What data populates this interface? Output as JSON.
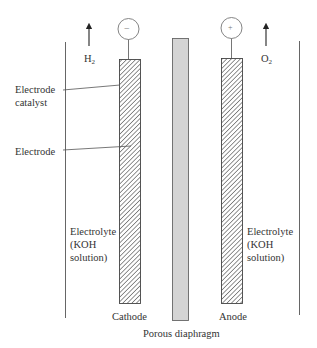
{
  "diagram": {
    "type": "alkaline water electrolysis cell",
    "gases": {
      "left": {
        "symbol": "H",
        "subscript": "2"
      },
      "right": {
        "symbol": "O",
        "subscript": "2"
      }
    },
    "terminals": {
      "left": "−",
      "right": "+"
    },
    "labels": {
      "electrode_catalyst_line1": "Electrode",
      "electrode_catalyst_line2": "catalyst",
      "electrode": "Electrode",
      "electrolyte_left_1": "Electrolyte",
      "electrolyte_left_2": "(KOH",
      "electrolyte_left_3": "solution)",
      "electrolyte_right_1": "Electrolyte",
      "electrolyte_right_2": "(KOH",
      "electrolyte_right_3": "solution)",
      "cathode": "Cathode",
      "anode": "Anode",
      "porous_diaphragm": "Porous diaphragm"
    },
    "colors": {
      "line": "#555555",
      "hatch": "#444444",
      "diaphragm_fill": "#d4d4d4",
      "diaphragm_stroke": "#666666"
    }
  }
}
